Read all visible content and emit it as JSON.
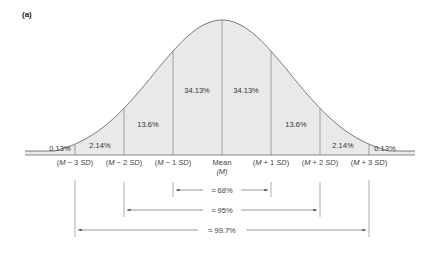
{
  "figure": {
    "panel_label": "(a)",
    "colors": {
      "fill": "#e9e9e9",
      "stroke": "#7a7a7a",
      "lines": "#888888",
      "text": "#333333"
    }
  },
  "axis": {
    "ticks": [
      {
        "pre": "(",
        "m": "M",
        "op": " − 3 ",
        "sd": "SD",
        "post": ")"
      },
      {
        "pre": "(",
        "m": "M",
        "op": " − 2 ",
        "sd": "SD",
        "post": ")"
      },
      {
        "pre": "(",
        "m": "M",
        "op": " − 1 ",
        "sd": "SD",
        "post": ")"
      },
      {
        "line1": "Mean",
        "line2": "(M)"
      },
      {
        "pre": "(",
        "m": "M",
        "op": " + 1 ",
        "sd": "SD",
        "post": ")"
      },
      {
        "pre": "(",
        "m": "M",
        "op": " + 2 ",
        "sd": "SD",
        "post": ")"
      },
      {
        "pre": "(",
        "m": "M",
        "op": " + 3 ",
        "sd": "SD",
        "post": ")"
      }
    ]
  },
  "regions": [
    "0.13%",
    "2.14%",
    "13.6%",
    "34.13%",
    "34.13%",
    "13.6%",
    "2.14%",
    "0.13%"
  ],
  "ranges": [
    {
      "label": "≈ 68%",
      "from_sd": -1,
      "to_sd": 1
    },
    {
      "label": "≈ 95%",
      "from_sd": -2,
      "to_sd": 2
    },
    {
      "label": "≈ 99.7%",
      "from_sd": -3,
      "to_sd": 3
    }
  ],
  "chart_data": {
    "type": "area",
    "x": [
      "M-3SD",
      "M-2SD",
      "M-1SD",
      "Mean (M)",
      "M+1SD",
      "M+2SD",
      "M+3SD"
    ],
    "segments": [
      {
        "range": "< M-3SD",
        "percent": 0.13
      },
      {
        "range": "M-3SD to M-2SD",
        "percent": 2.14
      },
      {
        "range": "M-2SD to M-1SD",
        "percent": 13.6
      },
      {
        "range": "M-1SD to M",
        "percent": 34.13
      },
      {
        "range": "M to M+1SD",
        "percent": 34.13
      },
      {
        "range": "M+1SD to M+2SD",
        "percent": 13.6
      },
      {
        "range": "M+2SD to M+3SD",
        "percent": 2.14
      },
      {
        "range": "> M+3SD",
        "percent": 0.13
      }
    ],
    "intervals": [
      {
        "range": "M±1SD",
        "percent": 68
      },
      {
        "range": "M±2SD",
        "percent": 95
      },
      {
        "range": "M±3SD",
        "percent": 99.7
      }
    ],
    "grid": false,
    "legend": false
  }
}
